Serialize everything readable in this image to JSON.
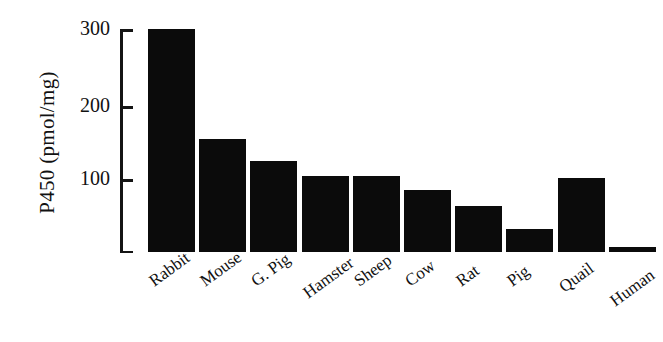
{
  "chart_data": {
    "type": "bar",
    "title": "",
    "subtitle": "",
    "xlabel": "",
    "ylabel": "P450 (pmol/mg)",
    "categories": [
      "Rabbit",
      "Mouse",
      "G. Pig",
      "Hamster",
      "Sheep",
      "Cow",
      "Rat",
      "Pig",
      "Quail",
      "Human"
    ],
    "values": [
      305,
      155,
      124,
      104,
      104,
      85,
      63,
      32,
      101,
      7
    ],
    "series": [
      {
        "name": "P450 content",
        "values": [
          305,
          155,
          124,
          104,
          104,
          85,
          63,
          32,
          101,
          7
        ]
      }
    ],
    "ylim": [
      0,
      310
    ],
    "yticks": [
      100,
      200,
      300
    ],
    "ytick_labels": [
      "100",
      "200",
      "300"
    ],
    "grid": false,
    "legend": false,
    "legend_position": "none",
    "bar_color": "#0b0b0b",
    "axis_color": "#141414",
    "background_color": "#ffffff",
    "xtick_label_rotation": -36,
    "annotations": []
  },
  "axis": {
    "ylabel": "P450 (pmol/mg)",
    "tick_300": "300",
    "tick_200": "200",
    "tick_100": "100"
  },
  "bars": [
    {
      "label": "Rabbit",
      "value": 305
    },
    {
      "label": "Mouse",
      "value": 155
    },
    {
      "label": "G. Pig",
      "value": 124
    },
    {
      "label": "Hamster",
      "value": 104
    },
    {
      "label": "Sheep",
      "value": 104
    },
    {
      "label": "Cow",
      "value": 85
    },
    {
      "label": "Rat",
      "value": 63
    },
    {
      "label": "Pig",
      "value": 32
    },
    {
      "label": "Quail",
      "value": 101
    },
    {
      "label": "Human",
      "value": 7
    }
  ]
}
